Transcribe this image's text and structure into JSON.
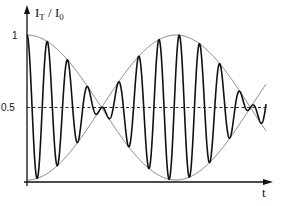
{
  "chart_data": {
    "type": "line",
    "title": "",
    "xlabel": "t",
    "ylabel": "I_T / I_0",
    "ylabel_parts": {
      "main": "I",
      "sub1": "T",
      "sep": " / ",
      "main2": "I",
      "sub2": "0"
    },
    "yticks": [
      {
        "value": 1,
        "label": "1"
      },
      {
        "value": 0.5,
        "label": "0.5"
      }
    ],
    "ylim": [
      0,
      1
    ],
    "grid": false,
    "reference_line": {
      "y": 0.5,
      "style": "dashed"
    },
    "series": [
      {
        "name": "transmitted intensity (beat signal)",
        "formula": "0.5 + 0.5*cos(2*pi*t/T_env)*cos(2*pi*t/T_carrier)",
        "T_env_fraction_of_plot": 0.35,
        "carrier_periods_per_envelope": 14.7,
        "stroke": "#111111",
        "width": 1.6
      },
      {
        "name": "upper envelope",
        "formula": "0.5 + 0.5*|cos(2*pi*t/T_env)| style (crossing curves)",
        "stroke": "#555555",
        "width": 0.8
      },
      {
        "name": "lower envelope",
        "formula": "0.5 - 0.5*cos(2*pi*t/T_env)",
        "stroke": "#555555",
        "width": 0.8
      }
    ],
    "key_points": {
      "envelope_max_t": [
        0,
        0.5
      ],
      "envelope_crossing_t": [
        0.25,
        0.75
      ],
      "envelope_max_value": 1,
      "crossing_value": 0.5
    }
  }
}
